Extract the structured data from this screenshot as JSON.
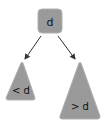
{
  "diagram": {
    "type": "binary-search-tree",
    "root": {
      "label": "d"
    },
    "left_subtree": {
      "label": "< d"
    },
    "right_subtree": {
      "label": "> d"
    },
    "edges": [
      {
        "from": "root",
        "to": "left_subtree"
      },
      {
        "from": "root",
        "to": "right_subtree"
      }
    ]
  },
  "colors": {
    "node_fill": "#9a9a9a",
    "node_stroke": "#a8a8a8",
    "arrow": "#333333",
    "text": "#111111"
  }
}
